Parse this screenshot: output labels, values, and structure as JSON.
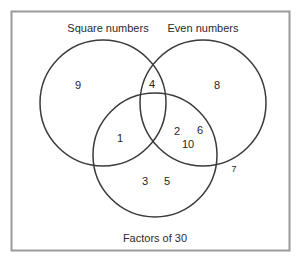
{
  "diagram": {
    "type": "venn-3-set",
    "title_visible": false,
    "universe": {
      "shape": "rectangle",
      "border_color": "#9a9a9a"
    },
    "circle_color": "#3a3a3a",
    "sets": [
      {
        "id": "square",
        "label": "Square numbers",
        "label_x": 108,
        "label_y": 29,
        "cx": 103,
        "cy": 103,
        "r": 63
      },
      {
        "id": "even",
        "label": "Even numbers",
        "label_x": 203,
        "label_y": 29,
        "cx": 203,
        "cy": 103,
        "r": 63
      },
      {
        "id": "factors",
        "label": "Factors of 30",
        "label_x": 155,
        "label_y": 239,
        "cx": 155,
        "cy": 155,
        "r": 62
      }
    ],
    "regions": [
      {
        "id": "square-only",
        "members": [
          "9"
        ],
        "x": 78,
        "y": 86
      },
      {
        "id": "even-only",
        "members": [
          "8"
        ],
        "x": 217,
        "y": 86
      },
      {
        "id": "factors-only",
        "members": [
          "3",
          "5"
        ],
        "x": 155,
        "y": 182
      },
      {
        "id": "square-even",
        "members": [
          "4"
        ],
        "x": 152,
        "y": 85
      },
      {
        "id": "square-factors",
        "members": [
          "1"
        ],
        "x": 120,
        "y": 139
      },
      {
        "id": "even-factors",
        "members": [
          "2",
          "6",
          "10"
        ],
        "x": 190,
        "y": 136
      },
      {
        "id": "all-three",
        "members": [],
        "x": 155,
        "y": 120
      },
      {
        "id": "outside-all",
        "members": [
          "7"
        ],
        "x": 234,
        "y": 170
      }
    ],
    "labels": {
      "square": "Square numbers",
      "even": "Even numbers",
      "factors": "Factors of 30"
    },
    "values": {
      "square_only_9": "9",
      "even_only_8": "8",
      "factors_only_3": "3",
      "factors_only_5": "5",
      "square_even_4": "4",
      "square_factors_1": "1",
      "even_factors_2": "2",
      "even_factors_6": "6",
      "even_factors_10": "10",
      "outside_7": "7"
    }
  }
}
